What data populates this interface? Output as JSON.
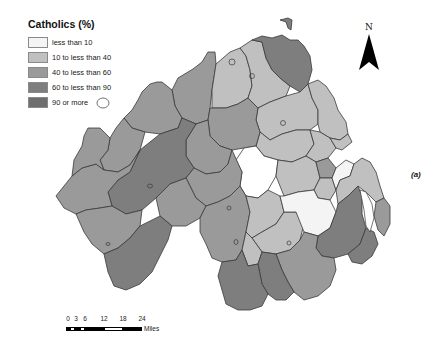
{
  "legend": {
    "title": "Catholics (%)",
    "items": [
      {
        "label": "less than 10",
        "color": "#f4f4f4"
      },
      {
        "label": "10 to less than 40",
        "color": "#c0c0c0"
      },
      {
        "label": "40 to less than 60",
        "color": "#9a9a9a"
      },
      {
        "label": "60 to less than 90",
        "color": "#7e7e7e"
      },
      {
        "label": "90 or more",
        "color": "#6e6e6e"
      }
    ]
  },
  "north_arrow": {
    "label": "N"
  },
  "panel_label": "(a)",
  "scale_bar": {
    "ticks": [
      "0",
      "3",
      "6",
      "12",
      "18",
      "24"
    ],
    "units": "Miles"
  },
  "map": {
    "subject": "Northern Ireland wards/districts by Catholic population share",
    "border_color": "#333333"
  }
}
